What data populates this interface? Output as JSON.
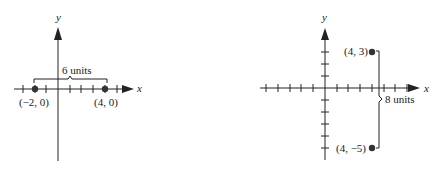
{
  "figures": [
    {
      "id": "horizontal-distance",
      "x_axis_label": "x",
      "y_axis_label": "y",
      "points": [
        {
          "label": "(−2, 0)",
          "x": -2,
          "y": 0
        },
        {
          "label": "(4, 0)",
          "x": 4,
          "y": 0
        }
      ],
      "distance_label": "6 units"
    },
    {
      "id": "vertical-distance",
      "x_axis_label": "x",
      "y_axis_label": "y",
      "points": [
        {
          "label": "(4, 3)",
          "x": 4,
          "y": 3
        },
        {
          "label": "(4, −5)",
          "x": 4,
          "y": -5
        }
      ],
      "distance_label": "8 units"
    }
  ],
  "colors": {
    "ink": "#222222",
    "point": "#333333"
  }
}
